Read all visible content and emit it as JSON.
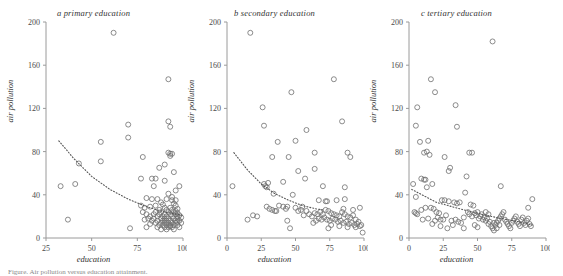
{
  "figure": {
    "caption": "Figure. Air pollution versus education attainment.",
    "axis_labels": {
      "x": "education",
      "y": "air pollution"
    }
  },
  "chart_data": [
    {
      "type": "scatter",
      "panel": "a",
      "title": "a primary education",
      "xlabel": "education",
      "ylabel": "air pollution",
      "xlim": [
        25,
        100
      ],
      "ylim": [
        0,
        200
      ],
      "xticks": [
        25,
        50,
        75,
        100
      ],
      "yticks": [
        0,
        40,
        80,
        120,
        160,
        200
      ],
      "grid": false,
      "legend": "none",
      "marker": "open-circle",
      "trend": {
        "style": "dotted",
        "shape": "power-decay",
        "points": [
          [
            32,
            90
          ],
          [
            40,
            74
          ],
          [
            50,
            57
          ],
          [
            60,
            45
          ],
          [
            70,
            36
          ],
          [
            80,
            29
          ],
          [
            90,
            24
          ],
          [
            100,
            21
          ]
        ]
      },
      "points": [
        [
          62,
          190
        ],
        [
          92,
          147
        ],
        [
          70,
          105
        ],
        [
          92,
          108
        ],
        [
          93,
          103
        ],
        [
          70,
          93
        ],
        [
          55,
          89
        ],
        [
          92,
          79
        ],
        [
          93,
          78
        ],
        [
          94,
          78
        ],
        [
          93,
          76
        ],
        [
          78,
          75
        ],
        [
          55,
          71
        ],
        [
          90,
          68
        ],
        [
          43,
          69
        ],
        [
          95,
          61
        ],
        [
          87,
          65
        ],
        [
          77,
          55
        ],
        [
          83,
          55
        ],
        [
          85,
          55
        ],
        [
          90,
          53
        ],
        [
          84,
          48
        ],
        [
          98,
          48
        ],
        [
          41,
          50
        ],
        [
          33,
          48
        ],
        [
          96,
          44
        ],
        [
          92,
          41
        ],
        [
          94,
          38
        ],
        [
          80,
          37
        ],
        [
          83,
          36
        ],
        [
          86,
          36
        ],
        [
          91,
          36
        ],
        [
          94,
          35
        ],
        [
          88,
          33
        ],
        [
          95,
          32
        ],
        [
          77,
          30
        ],
        [
          89,
          31
        ],
        [
          96,
          30
        ],
        [
          79,
          28
        ],
        [
          82,
          29
        ],
        [
          90,
          28
        ],
        [
          93,
          28
        ],
        [
          97,
          27
        ],
        [
          87,
          26
        ],
        [
          91,
          26
        ],
        [
          94,
          26
        ],
        [
          96,
          25
        ],
        [
          78,
          24
        ],
        [
          85,
          24
        ],
        [
          88,
          24
        ],
        [
          92,
          24
        ],
        [
          95,
          24
        ],
        [
          97,
          23
        ],
        [
          80,
          22
        ],
        [
          84,
          22
        ],
        [
          87,
          22
        ],
        [
          90,
          22
        ],
        [
          93,
          22
        ],
        [
          96,
          22
        ],
        [
          98,
          21
        ],
        [
          82,
          20
        ],
        [
          86,
          20
        ],
        [
          89,
          20
        ],
        [
          91,
          20
        ],
        [
          94,
          20
        ],
        [
          97,
          20
        ],
        [
          99,
          19
        ],
        [
          81,
          18
        ],
        [
          84,
          18
        ],
        [
          88,
          18
        ],
        [
          90,
          18
        ],
        [
          92,
          18
        ],
        [
          95,
          18
        ],
        [
          97,
          18
        ],
        [
          83,
          16
        ],
        [
          86,
          16
        ],
        [
          89,
          16
        ],
        [
          91,
          16
        ],
        [
          93,
          16
        ],
        [
          96,
          16
        ],
        [
          98,
          16
        ],
        [
          85,
          14
        ],
        [
          88,
          14
        ],
        [
          90,
          14
        ],
        [
          92,
          14
        ],
        [
          94,
          14
        ],
        [
          96,
          14
        ],
        [
          99,
          14
        ],
        [
          87,
          12
        ],
        [
          89,
          12
        ],
        [
          91,
          12
        ],
        [
          93,
          12
        ],
        [
          95,
          12
        ],
        [
          97,
          12
        ],
        [
          86,
          10
        ],
        [
          90,
          10
        ],
        [
          92,
          10
        ],
        [
          94,
          10
        ],
        [
          98,
          10
        ],
        [
          71,
          9
        ],
        [
          80,
          10
        ],
        [
          88,
          8
        ],
        [
          91,
          8
        ],
        [
          95,
          8
        ],
        [
          37,
          17
        ],
        [
          79,
          17
        ],
        [
          85,
          30
        ],
        [
          82,
          13
        ],
        [
          93,
          11
        ],
        [
          96,
          35
        ],
        [
          97,
          15
        ]
      ]
    },
    {
      "type": "scatter",
      "panel": "b",
      "title": "b secondary education",
      "xlabel": "education",
      "ylabel": "air pollution",
      "xlim": [
        0,
        100
      ],
      "ylim": [
        0,
        200
      ],
      "xticks": [
        0,
        25,
        50,
        75,
        100
      ],
      "yticks": [
        0,
        40,
        80,
        120,
        160,
        200
      ],
      "grid": false,
      "legend": "none",
      "marker": "open-circle",
      "trend": {
        "style": "dotted",
        "shape": "power-decay",
        "points": [
          [
            5,
            79
          ],
          [
            15,
            63
          ],
          [
            25,
            50
          ],
          [
            35,
            41
          ],
          [
            45,
            35
          ],
          [
            55,
            30
          ],
          [
            65,
            27
          ],
          [
            70,
            26
          ]
        ]
      },
      "points": [
        [
          17,
          190
        ],
        [
          78,
          147
        ],
        [
          47,
          135
        ],
        [
          26,
          121
        ],
        [
          84,
          108
        ],
        [
          58,
          100
        ],
        [
          27,
          104
        ],
        [
          50,
          90
        ],
        [
          37,
          89
        ],
        [
          64,
          79
        ],
        [
          33,
          75
        ],
        [
          88,
          79
        ],
        [
          90,
          75
        ],
        [
          52,
          62
        ],
        [
          64,
          64
        ],
        [
          45,
          75
        ],
        [
          57,
          55
        ],
        [
          30,
          51
        ],
        [
          27,
          50
        ],
        [
          28,
          48
        ],
        [
          29,
          47
        ],
        [
          41,
          52
        ],
        [
          70,
          48
        ],
        [
          86,
          47
        ],
        [
          34,
          41
        ],
        [
          48,
          40
        ],
        [
          67,
          35
        ],
        [
          72,
          34
        ],
        [
          73,
          34
        ],
        [
          80,
          35
        ],
        [
          86,
          36
        ],
        [
          44,
          29
        ],
        [
          50,
          28
        ],
        [
          55,
          29
        ],
        [
          33,
          26
        ],
        [
          35,
          25
        ],
        [
          36,
          25
        ],
        [
          31,
          27
        ],
        [
          29,
          29
        ],
        [
          44,
          16
        ],
        [
          46,
          9
        ],
        [
          15,
          17
        ],
        [
          19,
          21
        ],
        [
          22,
          20
        ],
        [
          4,
          48
        ],
        [
          64,
          23
        ],
        [
          66,
          22
        ],
        [
          68,
          24
        ],
        [
          70,
          22
        ],
        [
          72,
          26
        ],
        [
          74,
          25
        ],
        [
          76,
          23
        ],
        [
          78,
          22
        ],
        [
          80,
          21
        ],
        [
          82,
          20
        ],
        [
          84,
          24
        ],
        [
          86,
          22
        ],
        [
          88,
          20
        ],
        [
          90,
          19
        ],
        [
          92,
          21
        ],
        [
          94,
          17
        ],
        [
          96,
          15
        ],
        [
          98,
          12
        ],
        [
          63,
          14
        ],
        [
          65,
          16
        ],
        [
          67,
          18
        ],
        [
          69,
          17
        ],
        [
          71,
          19
        ],
        [
          73,
          17
        ],
        [
          75,
          16
        ],
        [
          77,
          18
        ],
        [
          79,
          17
        ],
        [
          81,
          15
        ],
        [
          83,
          16
        ],
        [
          85,
          14
        ],
        [
          87,
          15
        ],
        [
          89,
          13
        ],
        [
          91,
          14
        ],
        [
          93,
          12
        ],
        [
          95,
          13
        ],
        [
          97,
          11
        ],
        [
          99,
          5
        ],
        [
          74,
          9
        ],
        [
          76,
          12
        ],
        [
          82,
          11
        ],
        [
          88,
          10
        ],
        [
          94,
          10
        ],
        [
          60,
          22
        ],
        [
          58,
          25
        ],
        [
          62,
          20
        ],
        [
          56,
          21
        ],
        [
          54,
          26
        ],
        [
          52,
          25
        ],
        [
          41,
          29
        ],
        [
          38,
          30
        ],
        [
          43,
          27
        ],
        [
          97,
          28
        ],
        [
          92,
          26
        ],
        [
          85,
          27
        ]
      ]
    },
    {
      "type": "scatter",
      "panel": "c",
      "title": "c tertiary education",
      "xlabel": "education",
      "ylabel": "air pollution",
      "xlim": [
        0,
        100
      ],
      "ylim": [
        0,
        200
      ],
      "xticks": [
        0,
        25,
        50,
        75,
        100
      ],
      "yticks": [
        0,
        40,
        80,
        120,
        160,
        200
      ],
      "grid": false,
      "legend": "none",
      "marker": "open-circle",
      "trend": {
        "style": "dotted",
        "shape": "linear-decay",
        "points": [
          [
            2,
            45
          ],
          [
            20,
            33
          ],
          [
            40,
            26
          ],
          [
            60,
            20
          ],
          [
            80,
            15
          ],
          [
            90,
            12
          ]
        ]
      },
      "points": [
        [
          61,
          182
        ],
        [
          16,
          147
        ],
        [
          19,
          135
        ],
        [
          34,
          123
        ],
        [
          6,
          121
        ],
        [
          35,
          103
        ],
        [
          5,
          104
        ],
        [
          8,
          89
        ],
        [
          14,
          90
        ],
        [
          44,
          79
        ],
        [
          46,
          79
        ],
        [
          13,
          80
        ],
        [
          11,
          79
        ],
        [
          15,
          77
        ],
        [
          26,
          75
        ],
        [
          30,
          65
        ],
        [
          29,
          62
        ],
        [
          42,
          57
        ],
        [
          9,
          55
        ],
        [
          11,
          54
        ],
        [
          12,
          54
        ],
        [
          13,
          47
        ],
        [
          17,
          50
        ],
        [
          3,
          50
        ],
        [
          41,
          42
        ],
        [
          67,
          48
        ],
        [
          90,
          36
        ],
        [
          5,
          38
        ],
        [
          24,
          35
        ],
        [
          26,
          35
        ],
        [
          29,
          34
        ],
        [
          33,
          33
        ],
        [
          35,
          32
        ],
        [
          37,
          33
        ],
        [
          45,
          31
        ],
        [
          47,
          30
        ],
        [
          87,
          28
        ],
        [
          4,
          24
        ],
        [
          5,
          23
        ],
        [
          6,
          22
        ],
        [
          9,
          26
        ],
        [
          12,
          28
        ],
        [
          16,
          28
        ],
        [
          18,
          27
        ],
        [
          20,
          24
        ],
        [
          22,
          23
        ],
        [
          10,
          17
        ],
        [
          14,
          18
        ],
        [
          19,
          16
        ],
        [
          21,
          19
        ],
        [
          23,
          17
        ],
        [
          25,
          17
        ],
        [
          27,
          21
        ],
        [
          31,
          16
        ],
        [
          32,
          12
        ],
        [
          28,
          9
        ],
        [
          34,
          17
        ],
        [
          36,
          15
        ],
        [
          38,
          14
        ],
        [
          40,
          19
        ],
        [
          43,
          24
        ],
        [
          44,
          22
        ],
        [
          46,
          20
        ],
        [
          48,
          23
        ],
        [
          49,
          21
        ],
        [
          50,
          24
        ],
        [
          51,
          18
        ],
        [
          52,
          20
        ],
        [
          53,
          22
        ],
        [
          54,
          17
        ],
        [
          55,
          19
        ],
        [
          56,
          16
        ],
        [
          57,
          18
        ],
        [
          58,
          13
        ],
        [
          59,
          15
        ],
        [
          60,
          11
        ],
        [
          61,
          9
        ],
        [
          62,
          7
        ],
        [
          63,
          12
        ],
        [
          64,
          14
        ],
        [
          65,
          16
        ],
        [
          66,
          18
        ],
        [
          67,
          20
        ],
        [
          68,
          22
        ],
        [
          69,
          24
        ],
        [
          70,
          17
        ],
        [
          71,
          15
        ],
        [
          72,
          13
        ],
        [
          73,
          11
        ],
        [
          74,
          9
        ],
        [
          75,
          14
        ],
        [
          76,
          16
        ],
        [
          77,
          18
        ],
        [
          78,
          20
        ],
        [
          79,
          15
        ],
        [
          80,
          13
        ],
        [
          81,
          11
        ],
        [
          82,
          17
        ],
        [
          83,
          19
        ],
        [
          84,
          14
        ],
        [
          85,
          12
        ],
        [
          86,
          16
        ],
        [
          87,
          18
        ],
        [
          88,
          13
        ],
        [
          89,
          11
        ],
        [
          62,
          14
        ],
        [
          64,
          9
        ],
        [
          66,
          12
        ],
        [
          58,
          22
        ],
        [
          56,
          24
        ],
        [
          48,
          12
        ],
        [
          50,
          10
        ],
        [
          40,
          9
        ],
        [
          23,
          11
        ],
        [
          17,
          13
        ]
      ]
    }
  ]
}
